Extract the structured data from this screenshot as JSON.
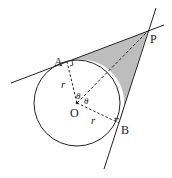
{
  "diagram": {
    "labels": {
      "A": "A",
      "P": "P",
      "B": "B",
      "O": "O",
      "r1": "r",
      "r2": "r",
      "theta1": "θ",
      "theta2": "θ"
    },
    "colors": {
      "stroke": "#222222",
      "shade": "#bdbdbd",
      "background": "#ffffff"
    },
    "geometry": {
      "center_O": [
        77,
        103
      ],
      "radius": 43,
      "tangent_A": [
        67,
        62
      ],
      "tangent_B": [
        119,
        123
      ],
      "external_point_P": [
        148,
        31
      ]
    }
  }
}
